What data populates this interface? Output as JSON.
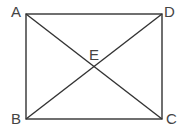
{
  "diagram": {
    "type": "rectangle-with-diagonals",
    "stroke_color": "#333333",
    "label_color": "#444444",
    "points": {
      "A": {
        "label": "A",
        "x": 26,
        "y": 14
      },
      "B": {
        "label": "B",
        "x": 26,
        "y": 119
      },
      "C": {
        "label": "C",
        "x": 162,
        "y": 119
      },
      "D": {
        "label": "D",
        "x": 162,
        "y": 14
      },
      "E": {
        "label": "E",
        "x": 94,
        "y": 66
      }
    },
    "segments": [
      "AD",
      "DC",
      "CB",
      "BA",
      "AC",
      "BD"
    ]
  }
}
